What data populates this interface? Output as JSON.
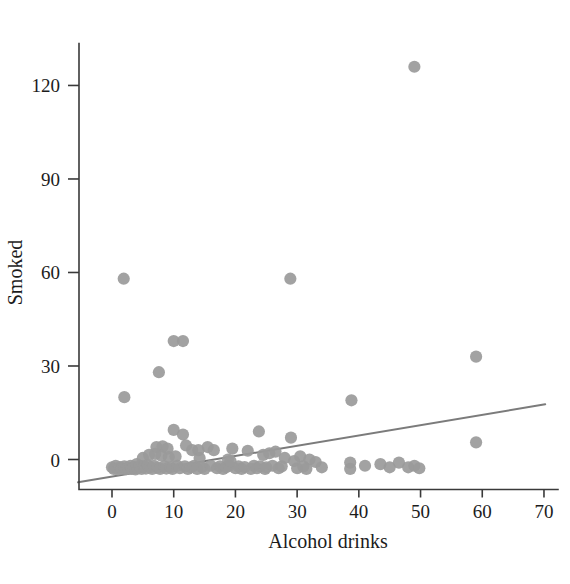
{
  "chart_data": {
    "type": "scatter",
    "title": "",
    "xlabel": "Alcohol drinks",
    "ylabel": "Smoked",
    "xlim": [
      -6,
      72
    ],
    "ylim": [
      -12,
      138
    ],
    "xticks": [
      0,
      10,
      20,
      30,
      40,
      50,
      60,
      70
    ],
    "yticks": [
      0,
      30,
      60,
      90,
      120
    ],
    "xtick_labels": [
      "0",
      "10",
      "20",
      "30",
      "40",
      "50",
      "60",
      "70"
    ],
    "ytick_labels": [
      "0",
      "30",
      "60",
      "90",
      "120"
    ],
    "grid": false,
    "legend": false,
    "marker_color": "#9a9a9a",
    "line_color": "#7b7b7b",
    "axis_color": "#3a3a3a",
    "fit_line": {
      "label": "linear fit",
      "intercept": -5.5,
      "slope": 0.33,
      "x_start": -5.5,
      "x_end": 70.2,
      "y_start": -7.3,
      "y_end": 17.7
    },
    "points": [
      [
        49.0,
        126.0
      ],
      [
        1.9,
        58.0
      ],
      [
        28.9,
        58.0
      ],
      [
        10.0,
        38.0
      ],
      [
        11.5,
        38.0
      ],
      [
        7.6,
        28.0
      ],
      [
        2.0,
        20.0
      ],
      [
        38.8,
        19.0
      ],
      [
        59.0,
        33.0
      ],
      [
        59.0,
        5.5
      ],
      [
        10.0,
        9.5
      ],
      [
        11.5,
        8.0
      ],
      [
        23.8,
        9.0
      ],
      [
        29.0,
        7.0
      ],
      [
        7.2,
        4.0
      ],
      [
        8.2,
        4.2
      ],
      [
        9.0,
        3.5
      ],
      [
        12.0,
        4.5
      ],
      [
        13.0,
        3.0
      ],
      [
        15.5,
        4.0
      ],
      [
        16.5,
        3.0
      ],
      [
        19.5,
        3.5
      ],
      [
        22.0,
        2.8
      ],
      [
        24.5,
        1.5
      ],
      [
        25.5,
        2.0
      ],
      [
        26.5,
        2.5
      ],
      [
        28.0,
        0.5
      ],
      [
        29.5,
        -0.5
      ],
      [
        30.5,
        1.0
      ],
      [
        32.0,
        0.0
      ],
      [
        33.0,
        -0.8
      ],
      [
        38.6,
        -1.0
      ],
      [
        38.6,
        -3.0
      ],
      [
        41.0,
        -2.0
      ],
      [
        43.5,
        -1.5
      ],
      [
        45.0,
        -2.5
      ],
      [
        46.5,
        -1.0
      ],
      [
        48.0,
        -2.5
      ],
      [
        49.0,
        -2.0
      ],
      [
        49.8,
        -2.8
      ],
      [
        0.0,
        -2.5
      ],
      [
        0.3,
        -3.0
      ],
      [
        0.6,
        -2.0
      ],
      [
        1.0,
        -3.2
      ],
      [
        1.3,
        -2.4
      ],
      [
        1.6,
        -3.0
      ],
      [
        2.0,
        -2.2
      ],
      [
        2.3,
        -3.1
      ],
      [
        2.6,
        -2.6
      ],
      [
        3.0,
        -2.0
      ],
      [
        3.2,
        -3.0
      ],
      [
        3.5,
        -2.4
      ],
      [
        3.8,
        -3.2
      ],
      [
        4.0,
        -1.5
      ],
      [
        4.2,
        -2.8
      ],
      [
        4.5,
        -2.0
      ],
      [
        4.8,
        -3.0
      ],
      [
        5.0,
        0.5
      ],
      [
        5.2,
        -2.2
      ],
      [
        5.5,
        -2.9
      ],
      [
        5.8,
        -1.8
      ],
      [
        6.0,
        1.5
      ],
      [
        6.2,
        -2.5
      ],
      [
        6.5,
        -3.0
      ],
      [
        6.8,
        -2.0
      ],
      [
        7.0,
        1.8
      ],
      [
        7.4,
        -2.6
      ],
      [
        7.8,
        -3.0
      ],
      [
        8.0,
        1.2
      ],
      [
        8.5,
        -2.2
      ],
      [
        8.8,
        -2.9
      ],
      [
        9.2,
        0.8
      ],
      [
        9.5,
        -2.5
      ],
      [
        9.8,
        -3.0
      ],
      [
        10.3,
        1.0
      ],
      [
        10.6,
        -2.0
      ],
      [
        11.0,
        -2.8
      ],
      [
        11.8,
        -2.2
      ],
      [
        12.3,
        -3.0
      ],
      [
        12.8,
        -2.5
      ],
      [
        13.3,
        -2.0
      ],
      [
        13.8,
        -3.0
      ],
      [
        14.2,
        0.5
      ],
      [
        14.6,
        -2.4
      ],
      [
        15.0,
        -3.0
      ],
      [
        16.0,
        -2.0
      ],
      [
        17.0,
        -2.8
      ],
      [
        17.5,
        -2.2
      ],
      [
        18.0,
        -3.0
      ],
      [
        18.5,
        -2.5
      ],
      [
        19.0,
        -2.0
      ],
      [
        20.0,
        -2.8
      ],
      [
        20.5,
        -2.2
      ],
      [
        21.0,
        -3.0
      ],
      [
        21.5,
        -2.4
      ],
      [
        22.5,
        -3.0
      ],
      [
        23.0,
        -2.0
      ],
      [
        23.5,
        -2.8
      ],
      [
        24.0,
        -2.2
      ],
      [
        24.8,
        -3.0
      ],
      [
        25.0,
        -2.5
      ],
      [
        26.0,
        -2.0
      ],
      [
        27.0,
        -2.8
      ],
      [
        27.5,
        -2.2
      ],
      [
        30.0,
        -2.8
      ],
      [
        31.0,
        -2.2
      ],
      [
        31.5,
        -3.0
      ],
      [
        34.0,
        -2.5
      ],
      [
        14.0,
        3.0
      ],
      [
        18.8,
        0.0
      ],
      [
        19.2,
        -0.5
      ]
    ]
  }
}
